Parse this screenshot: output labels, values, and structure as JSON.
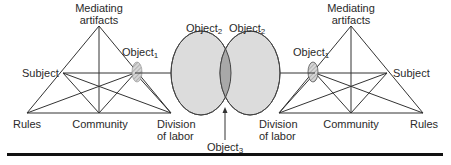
{
  "diagram": {
    "left_system": {
      "mediating_artifacts": [
        "Mediating",
        "artifacts"
      ],
      "subject": "Subject",
      "object": {
        "base": "Object",
        "sub": "1"
      },
      "rules": "Rules",
      "community": "Community",
      "division_of_labor": [
        "Division",
        "of labor"
      ]
    },
    "right_system": {
      "mediating_artifacts": [
        "Mediating",
        "artifacts"
      ],
      "subject": "Subject",
      "object": {
        "base": "Object",
        "sub": "1"
      },
      "rules": "Rules",
      "community": "Community",
      "division_of_labor": [
        "Division",
        "of labor"
      ]
    },
    "shared_objects": {
      "left": {
        "base": "Object",
        "sub": "2"
      },
      "right": {
        "base": "Object",
        "sub": "2"
      },
      "intersection": {
        "base": "Object",
        "sub": "3"
      }
    },
    "colors": {
      "line": "#333333",
      "ellipse_fill": "#dcdcdc",
      "intersection_fill": "#a8a8a8",
      "object1_fill": "#c8c8c8",
      "rule": "#111111"
    }
  }
}
